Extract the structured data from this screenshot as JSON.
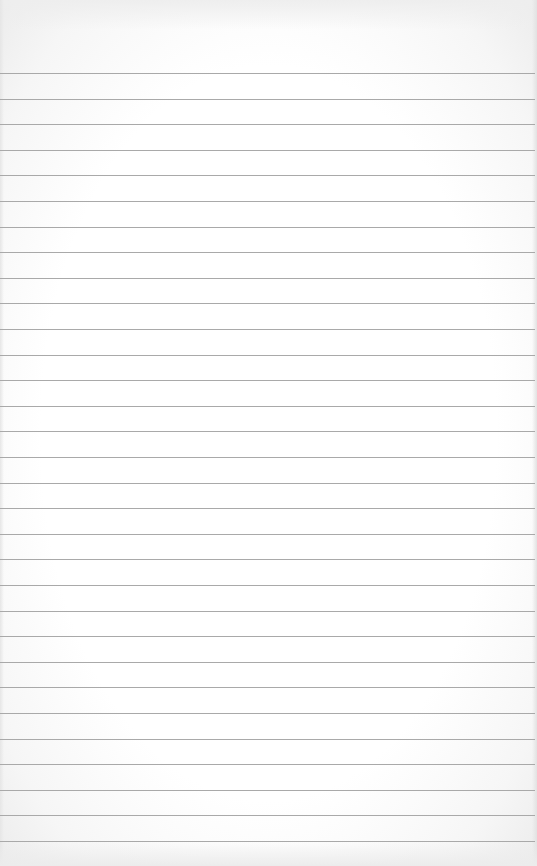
{
  "image": {
    "subject": "blank lined paper sheet",
    "background_color": "#ffffff",
    "rule_color": "#a9a9a9",
    "rules": {
      "count": 31,
      "first_y": 73,
      "spacing": 25.6
    }
  }
}
